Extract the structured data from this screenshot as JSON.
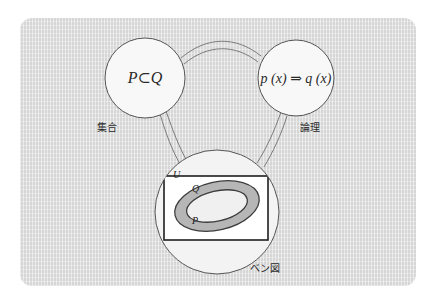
{
  "figure": {
    "background_color": "#ffffff",
    "panel_color": "#dcdcdc",
    "ink_color": "#444444",
    "node_fill": "#f7f7f7"
  },
  "nodes": [
    {
      "id": "set-node",
      "formula": "P⊂Q",
      "caption": "集合",
      "cx": 145,
      "cy": 78,
      "r": 40
    },
    {
      "id": "logic-node",
      "formula": "p (x) ⇒ q (x)",
      "caption": "論理",
      "cx": 296,
      "cy": 78,
      "r": 38
    },
    {
      "id": "venn-node",
      "formula": "",
      "caption": "ベン図",
      "cx": 217,
      "cy": 212,
      "r": 62
    }
  ],
  "connectors": [
    {
      "id": "set-to-logic",
      "from": "set-node",
      "to": "logic-node",
      "style": "double-line-arc"
    },
    {
      "id": "set-to-venn",
      "from": "set-node",
      "to": "venn-node",
      "style": "double-line-arc"
    },
    {
      "id": "logic-to-venn",
      "from": "logic-node",
      "to": "venn-node",
      "style": "double-line-arc"
    }
  ],
  "venn": {
    "universe_label": "U",
    "outer_set_label": "Q",
    "inner_set_label": "P",
    "universe_rect": {
      "x": 164,
      "y": 176,
      "w": 104,
      "h": 64
    },
    "outer_ellipse": {
      "cx": 217,
      "cy": 206,
      "rx": 43,
      "ry": 24,
      "rotate": -13,
      "fill": "#b4b4b4"
    },
    "inner_ellipse": {
      "cx": 217,
      "cy": 206,
      "rx": 31,
      "ry": 15,
      "rotate": -13,
      "fill": "#efefef"
    }
  },
  "caption_positions": {
    "set": {
      "x": 97,
      "y": 131
    },
    "logic": {
      "x": 300,
      "y": 131
    },
    "venn": {
      "x": 250,
      "y": 272
    }
  }
}
